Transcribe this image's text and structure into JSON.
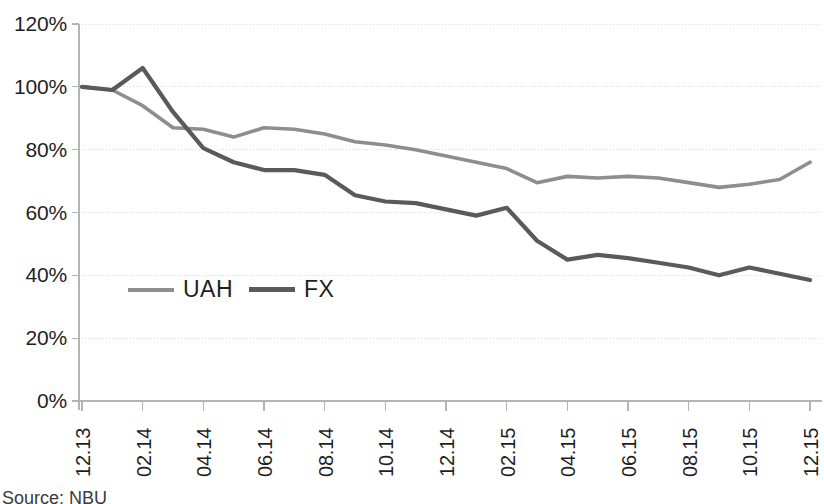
{
  "chart_data": {
    "type": "line",
    "title": "",
    "xlabel": "",
    "ylabel": "",
    "ylim": [
      0,
      120
    ],
    "ytick_labels": [
      "120%",
      "100%",
      "80%",
      "60%",
      "40%",
      "20%",
      "0%"
    ],
    "ytick_values": [
      120,
      100,
      80,
      60,
      40,
      20,
      0
    ],
    "grid": true,
    "grid_axis": "y",
    "legend_position": "inside-lower-left",
    "categories": [
      "12.13",
      "01.14",
      "02.14",
      "03.14",
      "04.14",
      "05.14",
      "06.14",
      "07.14",
      "08.14",
      "09.14",
      "10.14",
      "11.14",
      "12.14",
      "01.15",
      "02.15",
      "03.15",
      "04.15",
      "05.15",
      "06.15",
      "07.15",
      "08.15",
      "09.15",
      "10.15",
      "11.15",
      "12.15"
    ],
    "xtick_labels": [
      "12.13",
      "02.14",
      "04.14",
      "06.14",
      "08.14",
      "10.14",
      "12.14",
      "02.15",
      "04.15",
      "06.15",
      "08.15",
      "10.15",
      "12.15"
    ],
    "series": [
      {
        "name": "UAH",
        "color": "#8e8e8e",
        "values": [
          100.0,
          99.0,
          94.0,
          87.0,
          86.5,
          84.0,
          87.0,
          86.5,
          85.0,
          82.5,
          81.5,
          80.0,
          78.0,
          76.0,
          74.0,
          69.5,
          71.5,
          71.0,
          71.5,
          71.0,
          69.5,
          68.0,
          69.0,
          70.5,
          76.0
        ]
      },
      {
        "name": "FX",
        "color": "#5a5a5a",
        "values": [
          100.0,
          99.0,
          106.0,
          92.0,
          80.5,
          76.0,
          73.5,
          73.5,
          72.0,
          65.5,
          63.5,
          63.0,
          61.0,
          59.0,
          61.5,
          51.0,
          45.0,
          46.5,
          45.5,
          44.0,
          42.5,
          40.0,
          42.5,
          40.5,
          38.5
        ]
      }
    ],
    "legend": [
      {
        "label": "UAH",
        "color": "#8e8e8e"
      },
      {
        "label": "FX",
        "color": "#5a5a5a"
      }
    ],
    "source_note": "Source: NBU"
  },
  "axis": {
    "y_labels": [
      "120%",
      "100%",
      "80%",
      "60%",
      "40%",
      "20%",
      "0%"
    ],
    "x_labels": [
      "12.13",
      "02.14",
      "04.14",
      "06.14",
      "08.14",
      "10.14",
      "12.14",
      "02.15",
      "04.15",
      "06.15",
      "08.15",
      "10.15",
      "12.15"
    ]
  },
  "legend": {
    "uah_label": "UAH",
    "fx_label": "FX"
  },
  "footer": {
    "source": "Source: NBU"
  },
  "colors": {
    "uah_line": "#8e8e8e",
    "fx_line": "#5a5a5a",
    "axis": "#b4b4b4",
    "grid": "#d9d9d9",
    "text": "#1f1f1f"
  }
}
